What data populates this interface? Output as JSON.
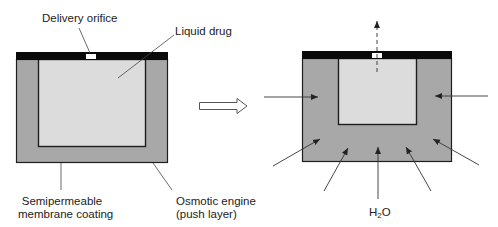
{
  "figure": {
    "left_device": {
      "labels": {
        "orifice": "Delivery orifice",
        "drug": "Liquid drug",
        "membrane_line1": "Semipermeable",
        "membrane_line2": "membrane coating",
        "engine_line1": "Osmotic engine",
        "engine_line2": "(push layer)"
      }
    },
    "transition_arrow": "hollow-right-arrow",
    "right_device": {
      "water_label_main": "H",
      "water_label_sub": "2",
      "water_label_tail": "O",
      "inflow_arrow_count": 7,
      "outflow_arrow": "dashed-up-arrow"
    },
    "colors": {
      "cap": "#0a0a0a",
      "engine": "#a8a8a8",
      "drug": "#dcdcdc",
      "outline": "#1e1e1e",
      "leader": "#444444",
      "orifice": "#ffffff"
    }
  }
}
